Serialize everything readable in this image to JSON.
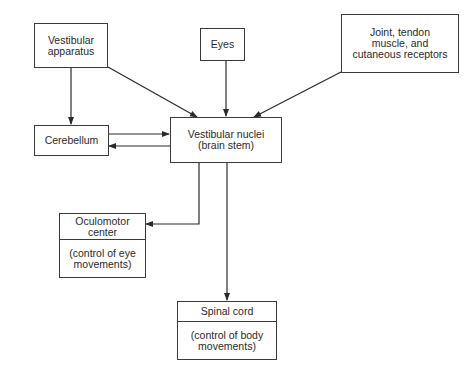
{
  "diagram": {
    "type": "flowchart",
    "nodes": {
      "vestibular_apparatus": {
        "lines": [
          "Vestibular",
          "apparatus"
        ]
      },
      "eyes": {
        "lines": [
          "Eyes"
        ]
      },
      "receptors": {
        "lines": [
          "Joint, tendon",
          "muscle, and",
          "cutaneous receptors"
        ]
      },
      "cerebellum": {
        "lines": [
          "Cerebellum"
        ]
      },
      "vestibular_nuclei": {
        "lines": [
          "Vestibular nuclei",
          "(brain stem)"
        ]
      },
      "oculomotor": {
        "title_lines": [
          "Oculomotor",
          "center"
        ],
        "desc_lines": [
          "(control of eye",
          "movements)"
        ]
      },
      "spinal_cord": {
        "title_lines": [
          "Spinal cord"
        ],
        "desc_lines": [
          "(control of body",
          "movements)"
        ]
      }
    },
    "edges": [
      {
        "from": "Vestibular apparatus",
        "to": "Cerebellum"
      },
      {
        "from": "Vestibular apparatus",
        "to": "Vestibular nuclei"
      },
      {
        "from": "Eyes",
        "to": "Vestibular nuclei"
      },
      {
        "from": "Joint, tendon muscle, and cutaneous receptors",
        "to": "Vestibular nuclei"
      },
      {
        "from": "Cerebellum",
        "to": "Vestibular nuclei"
      },
      {
        "from": "Vestibular nuclei",
        "to": "Cerebellum"
      },
      {
        "from": "Vestibular nuclei",
        "to": "Oculomotor center"
      },
      {
        "from": "Vestibular nuclei",
        "to": "Spinal cord"
      }
    ],
    "colors": {
      "line": "#2a2a2a",
      "background": "#ffffff"
    }
  }
}
